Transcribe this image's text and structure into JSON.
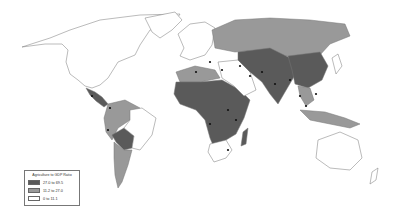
{
  "map": {
    "title": "Agriculture to GDP Ratio",
    "colors": {
      "high": "#5a5a5a",
      "mid": "#999999",
      "low": "#ffffff",
      "outline": "#777777",
      "marker": "#111111"
    },
    "legend": {
      "title": "Agriculture to GDP Ratio",
      "items": [
        {
          "label": "27.0 to 69.5",
          "class": "high",
          "color": "#5a5a5a"
        },
        {
          "label": "11.2 to 27.0",
          "class": "mid",
          "color": "#999999"
        },
        {
          "label": "0 to 11.1",
          "class": "low",
          "color": "#ffffff"
        }
      ]
    },
    "regions": [
      {
        "name": "North America",
        "class": "low"
      },
      {
        "name": "Greenland",
        "class": "low"
      },
      {
        "name": "Central America",
        "class": "high"
      },
      {
        "name": "South America north-west",
        "class": "mid"
      },
      {
        "name": "Bolivia/Paraguay",
        "class": "high"
      },
      {
        "name": "Southern South America",
        "class": "mid"
      },
      {
        "name": "Europe",
        "class": "low"
      },
      {
        "name": "Russia",
        "class": "mid"
      },
      {
        "name": "North Africa",
        "class": "mid"
      },
      {
        "name": "Sub-Saharan Africa",
        "class": "high"
      },
      {
        "name": "Southern Africa",
        "class": "low"
      },
      {
        "name": "Madagascar",
        "class": "high"
      },
      {
        "name": "Middle East",
        "class": "low"
      },
      {
        "name": "Central & South Asia",
        "class": "high"
      },
      {
        "name": "China",
        "class": "high"
      },
      {
        "name": "Southeast Asia",
        "class": "mid"
      },
      {
        "name": "Indonesia / Papua",
        "class": "mid"
      },
      {
        "name": "Japan & Korea",
        "class": "low"
      },
      {
        "name": "Australia",
        "class": "low"
      },
      {
        "name": "New Zealand",
        "class": "low"
      }
    ]
  }
}
